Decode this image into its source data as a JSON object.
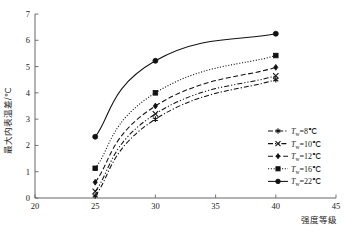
{
  "chart_data": {
    "type": "line",
    "title": "",
    "xlabel": "强度等级",
    "ylabel": "最大内表温差/℃",
    "x": [
      25,
      30,
      40
    ],
    "xlim": [
      20,
      45
    ],
    "ylim": [
      0,
      7
    ],
    "xticks": [
      "20",
      "25",
      "30",
      "35",
      "40",
      "45"
    ],
    "yticks": [
      "0",
      "1",
      "2",
      "3",
      "4",
      "5",
      "6",
      "7"
    ],
    "grid": false,
    "legend_position": "right-middle",
    "series": [
      {
        "name": "Tw=8℃",
        "label_prefix": "T",
        "label_sub": "w",
        "label_suffix": "=8℃",
        "marker": "asterisk",
        "linestyle": "dash-dot",
        "values": [
          0.08,
          3.0,
          4.5
        ]
      },
      {
        "name": "Tw=10℃",
        "label_prefix": "T",
        "label_sub": "w",
        "label_suffix": "=10℃",
        "marker": "cross",
        "linestyle": "dash-dot-dot",
        "values": [
          0.25,
          3.2,
          4.65
        ]
      },
      {
        "name": "Tw=12℃",
        "label_prefix": "T",
        "label_sub": "w",
        "label_suffix": "=12℃",
        "marker": "diamond",
        "linestyle": "dashed",
        "values": [
          0.6,
          3.5,
          4.97
        ]
      },
      {
        "name": "Tw=16℃",
        "label_prefix": "T",
        "label_sub": "w",
        "label_suffix": "=16℃",
        "marker": "square",
        "linestyle": "dotted",
        "values": [
          1.13,
          4.0,
          5.42
        ]
      },
      {
        "name": "Tw=22℃",
        "label_prefix": "T",
        "label_sub": "w",
        "label_suffix": "=22℃",
        "marker": "circle",
        "linestyle": "solid",
        "values": [
          2.33,
          5.22,
          6.25
        ]
      }
    ],
    "colors": {
      "line": "#111111",
      "axis": "#555555",
      "text": "#1a1a1a",
      "background": "#ffffff"
    }
  }
}
